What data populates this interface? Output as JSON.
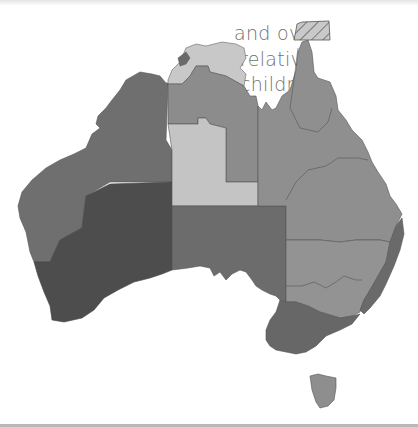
{
  "caption": {
    "lines": [
      "and over",
      "relative",
      "children,"
    ]
  },
  "map": {
    "title": "Australia choropleth map",
    "regions": [
      {
        "name": "Western Australia (north)",
        "shade": "medium-dark",
        "color": "#6f6f6f"
      },
      {
        "name": "Western Australia (south/southwest)",
        "shade": "darkest",
        "color": "#4d4d4d"
      },
      {
        "name": "Northern Territory (top end)",
        "shade": "lightest",
        "color": "#c8c8c8"
      },
      {
        "name": "Northern Territory (Darwin)",
        "shade": "dark",
        "color": "#6a6a6a"
      },
      {
        "name": "Northern Territory (central north)",
        "shade": "medium",
        "color": "#8c8c8c"
      },
      {
        "name": "Northern Territory (central)",
        "shade": "light",
        "color": "#c4c4c4"
      },
      {
        "name": "South Australia",
        "shade": "medium-dark",
        "color": "#6c6c6c"
      },
      {
        "name": "Queensland",
        "shade": "medium",
        "color": "#8f8f8f"
      },
      {
        "name": "New South Wales (inland)",
        "shade": "medium",
        "color": "#939393"
      },
      {
        "name": "New South Wales (coast)",
        "shade": "dark",
        "color": "#6a6a6a"
      },
      {
        "name": "Victoria",
        "shade": "dark",
        "color": "#676767"
      },
      {
        "name": "Tasmania",
        "shade": "medium",
        "color": "#8e8e8e"
      },
      {
        "name": "Torres Strait (hatched)",
        "shade": "hatched",
        "color": "#c9c9c9"
      }
    ]
  }
}
